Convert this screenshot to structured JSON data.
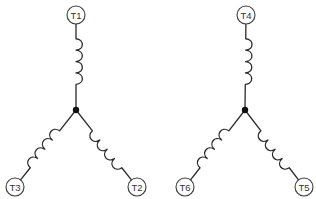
{
  "diagram": {
    "title": "",
    "colors": {
      "line": "#2a2a2a",
      "junction": "#111111",
      "circle_stroke": "#3a3a3a",
      "label": "#333333",
      "background": "#ffffff"
    },
    "wye_left": {
      "junction": {
        "x": 76,
        "y": 110
      },
      "terminals": [
        {
          "id": "T1",
          "label": "T1",
          "x": 76,
          "y": 15,
          "position": "top"
        },
        {
          "id": "T2",
          "label": "T2",
          "x": 137,
          "y": 187,
          "position": "bottom-right"
        },
        {
          "id": "T3",
          "label": "T3",
          "x": 15,
          "y": 187,
          "position": "bottom-left"
        }
      ]
    },
    "wye_right": {
      "junction": {
        "x": 245,
        "y": 110
      },
      "terminals": [
        {
          "id": "T4",
          "label": "T4",
          "x": 246,
          "y": 15,
          "position": "top"
        },
        {
          "id": "T5",
          "label": "T5",
          "x": 304,
          "y": 187,
          "position": "bottom-right"
        },
        {
          "id": "T6",
          "label": "T6",
          "x": 185,
          "y": 187,
          "position": "bottom-left"
        }
      ]
    }
  }
}
